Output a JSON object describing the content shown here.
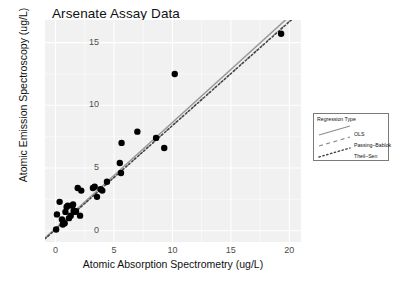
{
  "chart_data": {
    "type": "scatter",
    "title": "Arsenate Assay Data",
    "xlabel": "Atomic Absorption Spectrometry (ug/L)",
    "ylabel": "Atomic Emission Spectroscopy (ug/L)",
    "xlim": [
      -0.9,
      21.0
    ],
    "ylim": [
      -0.9,
      16.8
    ],
    "xticks": [
      0,
      5,
      10,
      15,
      20
    ],
    "yticks": [
      0,
      5,
      10,
      15
    ],
    "xtick_labels": [
      "0",
      "5",
      "10",
      "15",
      "20"
    ],
    "ytick_labels": [
      "0",
      "5",
      "10",
      "15"
    ],
    "grid": true,
    "grid_color": "#ffffff",
    "panel_background": "#f1f1f1",
    "point_color": "#000000",
    "point_size": 3.2,
    "legend_position": "right",
    "points": [
      {
        "x": 0.05,
        "y": 0.1
      },
      {
        "x": 0.12,
        "y": 1.3
      },
      {
        "x": 0.35,
        "y": 2.3
      },
      {
        "x": 0.55,
        "y": 0.9
      },
      {
        "x": 0.62,
        "y": 0.5
      },
      {
        "x": 0.78,
        "y": 0.6
      },
      {
        "x": 0.85,
        "y": 1.5
      },
      {
        "x": 0.95,
        "y": 1.9
      },
      {
        "x": 1.05,
        "y": 2.0
      },
      {
        "x": 1.15,
        "y": 1.0
      },
      {
        "x": 1.3,
        "y": 1.2
      },
      {
        "x": 1.45,
        "y": 2.0
      },
      {
        "x": 1.5,
        "y": 2.1
      },
      {
        "x": 1.55,
        "y": 1.6
      },
      {
        "x": 1.62,
        "y": 1.5
      },
      {
        "x": 1.75,
        "y": 1.55
      },
      {
        "x": 1.9,
        "y": 3.4
      },
      {
        "x": 2.1,
        "y": 1.2
      },
      {
        "x": 2.2,
        "y": 3.2
      },
      {
        "x": 3.2,
        "y": 3.4
      },
      {
        "x": 3.35,
        "y": 3.5
      },
      {
        "x": 3.55,
        "y": 2.7
      },
      {
        "x": 3.85,
        "y": 3.3
      },
      {
        "x": 4.0,
        "y": 3.2
      },
      {
        "x": 4.4,
        "y": 3.9
      },
      {
        "x": 5.5,
        "y": 5.4
      },
      {
        "x": 5.6,
        "y": 4.6
      },
      {
        "x": 5.65,
        "y": 7.0
      },
      {
        "x": 7.0,
        "y": 7.9
      },
      {
        "x": 8.6,
        "y": 7.4
      },
      {
        "x": 9.3,
        "y": 6.6
      },
      {
        "x": 10.2,
        "y": 12.5
      },
      {
        "x": 19.3,
        "y": 15.7
      }
    ],
    "series": [
      {
        "name": "OLS",
        "type": "line",
        "style": "solid",
        "color": "#999999",
        "intercept": 0.18,
        "slope": 0.845
      },
      {
        "name": "Passing-Bablok",
        "type": "line",
        "style": "dashed",
        "color": "#999999",
        "intercept": 0.1,
        "slope": 0.83
      },
      {
        "name": "Theil-Sen",
        "type": "line",
        "style": "dotted",
        "color": "#444444",
        "intercept": 0.1,
        "slope": 0.828
      }
    ]
  },
  "legend": {
    "title": "Regression Type",
    "entries": [
      {
        "label": "OLS",
        "style": "solid"
      },
      {
        "label": "Passing–Bablok",
        "style": "dashed"
      },
      {
        "label": "Theil–Sen",
        "style": "dotted"
      }
    ]
  }
}
